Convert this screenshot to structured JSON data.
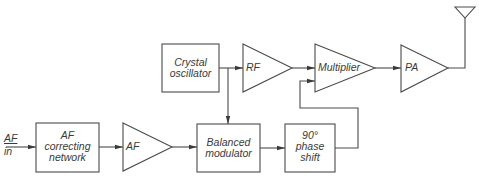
{
  "diagram": {
    "type": "block-diagram",
    "input_label": [
      "AF",
      "in"
    ],
    "blocks": [
      {
        "id": "af-correcting",
        "shape": "box",
        "lines": [
          "AF",
          "correcting",
          "network"
        ]
      },
      {
        "id": "af-amp",
        "shape": "triangle",
        "lines": [
          "AF"
        ]
      },
      {
        "id": "balanced-modulator",
        "shape": "box",
        "lines": [
          "Balanced",
          "modulator"
        ]
      },
      {
        "id": "phase-shift",
        "shape": "box",
        "lines": [
          "90°",
          "phase",
          "shift"
        ]
      },
      {
        "id": "crystal-oscillator",
        "shape": "box",
        "lines": [
          "Crystal",
          "oscillator"
        ]
      },
      {
        "id": "rf-amp",
        "shape": "triangle",
        "lines": [
          "RF"
        ]
      },
      {
        "id": "multiplier",
        "shape": "triangle",
        "lines": [
          "Multiplier"
        ]
      },
      {
        "id": "pa",
        "shape": "triangle",
        "lines": [
          "PA"
        ]
      },
      {
        "id": "antenna",
        "shape": "antenna",
        "lines": []
      }
    ],
    "connections": [
      [
        "AF in",
        "af-correcting"
      ],
      [
        "af-correcting",
        "af-amp"
      ],
      [
        "af-amp",
        "balanced-modulator"
      ],
      [
        "crystal-oscillator",
        "rf-amp"
      ],
      [
        "crystal-oscillator",
        "balanced-modulator"
      ],
      [
        "balanced-modulator",
        "phase-shift"
      ],
      [
        "rf-amp",
        "multiplier"
      ],
      [
        "phase-shift",
        "multiplier"
      ],
      [
        "multiplier",
        "pa"
      ],
      [
        "pa",
        "antenna"
      ]
    ],
    "colors": {
      "stroke": "#4a4a4a",
      "text": "#3a3a3a",
      "background": "#ffffff"
    }
  }
}
